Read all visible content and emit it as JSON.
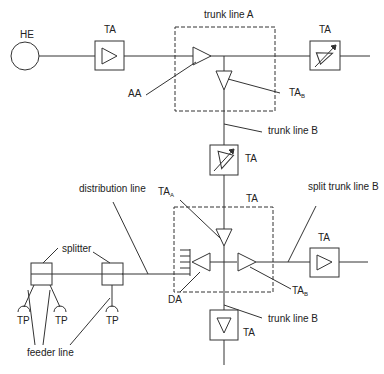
{
  "diagram": {
    "type": "cable network topology",
    "nodes": {
      "head_end": {
        "label": "HE"
      },
      "trunk_amp_1": {
        "label": "TA"
      },
      "trunk_amp_right": {
        "label": "TA"
      },
      "trunk_amp_vertical": {
        "label": "TA"
      },
      "bridger_box_top": {
        "label": "trunk line A"
      },
      "bridger_box_bottom": {
        "label": "TA"
      },
      "split_amp": {
        "label": "TA"
      },
      "bottom_amp": {
        "label": "TA"
      }
    },
    "labels": {
      "aa": "AA",
      "ta_b_top": "TA",
      "ta_b_top_sub": "B",
      "trunk_line_b_1": "trunk line B",
      "trunk_line_b_2": "trunk line B",
      "distribution_line": "distribution line",
      "ta_a": "TA",
      "ta_a_sub": "A",
      "split_trunk_line_b": "split trunk line B",
      "ta_b_bottom": "TA",
      "ta_b_bottom_sub": "B",
      "da": "DA",
      "splitter": "splitter",
      "tp1": "TP",
      "tp2": "TP",
      "tp3": "TP",
      "feeder_line": "feeder line"
    }
  }
}
